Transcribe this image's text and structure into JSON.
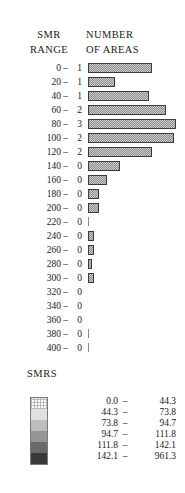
{
  "header": {
    "left_line1": "SMR",
    "left_line2": "RANGE",
    "right_line1": "NUMBER",
    "right_line2": "OF AREAS"
  },
  "legend": {
    "title": "SMRS",
    "classes": [
      {
        "lo": "0.0",
        "dash": "–",
        "hi": "44.3",
        "color": "#fdfdfd"
      },
      {
        "lo": "44.3",
        "dash": "–",
        "hi": "73.8",
        "color": "#e0e0e0"
      },
      {
        "lo": "73.8",
        "dash": "–",
        "hi": "94.7",
        "color": "#bdbdbd"
      },
      {
        "lo": "94.7",
        "dash": "–",
        "hi": "111.8",
        "color": "#959595"
      },
      {
        "lo": "111.8",
        "dash": "–",
        "hi": "142.1",
        "color": "#6a6a6a"
      },
      {
        "lo": "142.1",
        "dash": "–",
        "hi": "961.3",
        "color": "#383838"
      }
    ]
  },
  "chart_data": {
    "type": "bar",
    "orientation": "horizontal",
    "xlabel": "NUMBER OF AREAS",
    "ylabel": "SMR RANGE",
    "grid": false,
    "legend_position": "bottom",
    "categories": [
      "0 –",
      "20 –",
      "40 –",
      "60 –",
      "80 –",
      "100 –",
      "120 –",
      "140 –",
      "160 –",
      "180 –",
      "200 –",
      "220 –",
      "240 –",
      "260 –",
      "280 –",
      "300 –",
      "320 –",
      "340 –",
      "360 –",
      "380 –",
      "400 –"
    ],
    "counts": [
      1,
      1,
      1,
      2,
      3,
      2,
      2,
      0,
      0,
      0,
      0,
      0,
      0,
      0,
      0,
      0,
      0,
      0,
      0,
      0,
      0
    ],
    "bar_lengths": [
      64,
      27,
      61,
      78,
      88,
      86,
      64,
      32,
      19,
      11,
      11,
      2,
      6,
      6,
      4,
      6,
      0,
      0,
      0,
      2,
      2
    ],
    "xlim": [
      0,
      95
    ]
  }
}
